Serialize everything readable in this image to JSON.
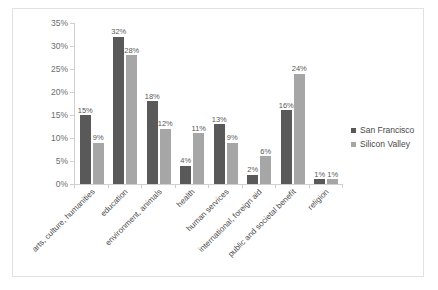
{
  "chart_data": {
    "type": "bar",
    "title": "",
    "xlabel": "",
    "ylabel": "",
    "ylim": [
      0,
      35
    ],
    "ytick_step": 5,
    "ytick_labels": [
      "0%",
      "5%",
      "10%",
      "15%",
      "20%",
      "25%",
      "30%",
      "35%"
    ],
    "grid": false,
    "legend_position": "right",
    "categories": [
      "arts, culture, humanities",
      "education",
      "environment, animals",
      "health",
      "human services",
      "international, foreign aid",
      "public and societal benefit",
      "religion"
    ],
    "series": [
      {
        "name": "San Francisco",
        "color": "#595959",
        "values": [
          15,
          32,
          18,
          4,
          13,
          2,
          16,
          1
        ],
        "labels": [
          "15%",
          "32%",
          "18%",
          "4%",
          "13%",
          "2%",
          "16%",
          "1%"
        ]
      },
      {
        "name": "Silicon Valley",
        "color": "#a6a6a6",
        "values": [
          9,
          28,
          12,
          11,
          9,
          6,
          24,
          1
        ],
        "labels": [
          "9%",
          "28%",
          "12%",
          "11%",
          "9%",
          "6%",
          "24%",
          "1%"
        ]
      }
    ]
  },
  "legend": {
    "items": [
      {
        "label": "San Francisco",
        "color": "#595959",
        "marker": "square-icon"
      },
      {
        "label": "Silicon Valley",
        "color": "#a6a6a6",
        "marker": "square-icon"
      }
    ]
  }
}
